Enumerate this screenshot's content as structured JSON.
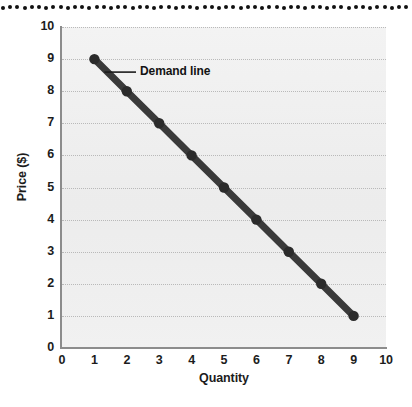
{
  "figure": {
    "background_color": "#ffffff",
    "plot_background_color": "#efefef",
    "gridline_color": "#b9b9b9",
    "axis_color": "#8c8c8c",
    "line_color": "#3a3a3a",
    "marker_color": "#2b2b2b",
    "text_color": "#1c1c1c"
  },
  "decoration": {
    "top_dot_strip": {
      "name": "dotted-strip",
      "dot_color": "#111111",
      "dot_count": 57,
      "dot_spacing_px": 7.2,
      "dot_diameter_px": 4
    }
  },
  "annotations": [
    {
      "label": "Demand line",
      "points_to_x": 1,
      "points_to_y": 9
    }
  ],
  "chart_data": {
    "type": "line",
    "title": "",
    "subtitle": "",
    "xlabel": "Quantity",
    "ylabel": "Price ($)",
    "xlim": [
      0,
      10
    ],
    "ylim": [
      0,
      10
    ],
    "xticks": [
      "0",
      "1",
      "2",
      "3",
      "4",
      "5",
      "6",
      "7",
      "8",
      "9",
      "10"
    ],
    "yticks": [
      "0",
      "1",
      "2",
      "3",
      "4",
      "5",
      "6",
      "7",
      "8",
      "9",
      "10"
    ],
    "grid": "horizontal-dotted",
    "legend": "none",
    "legend_position": "none",
    "series": [
      {
        "name": "Demand line",
        "x": [
          1,
          2,
          3,
          4,
          5,
          6,
          7,
          8,
          9
        ],
        "values": [
          9,
          8,
          7,
          6,
          5,
          4,
          3,
          2,
          1
        ],
        "marker": "circle",
        "line_width_px": 7
      }
    ],
    "annotations": [
      "Demand line"
    ]
  }
}
